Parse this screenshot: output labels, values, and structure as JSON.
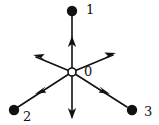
{
  "figure": {
    "colors": {
      "stroke": "#111111",
      "dot_fill": "#111111",
      "origin_fill": "#ffffff",
      "background": "#ffffff"
    },
    "geometry": {
      "origin": {
        "x": 72,
        "y": 72,
        "radius": 4
      },
      "dot_radius": 5,
      "stroke_width": 1.6
    }
  },
  "labels": {
    "origin": "0",
    "node_1": "1",
    "node_2": "2",
    "node_3": "3"
  },
  "nodes": [
    {
      "id": "origin",
      "label": "0",
      "x": 72,
      "y": 72,
      "style": "open-circle"
    },
    {
      "id": "node-1",
      "label": "1",
      "x": 72,
      "y": 11,
      "style": "filled-dot"
    },
    {
      "id": "node-2",
      "label": "2",
      "x": 14,
      "y": 110,
      "style": "filled-dot"
    },
    {
      "id": "node-3",
      "label": "3",
      "x": 132,
      "y": 110,
      "style": "filled-dot"
    }
  ],
  "rays": [
    {
      "id": "ray-up",
      "from": [
        72,
        72
      ],
      "to": [
        72,
        13
      ],
      "arrow_at": [
        72,
        42
      ],
      "arrow_dir": "up",
      "terminates_at_dot": true
    },
    {
      "id": "ray-down-left",
      "from": [
        72,
        72
      ],
      "to": [
        18,
        108
      ],
      "arrow_at": [
        43,
        89
      ],
      "arrow_dir": "down-left",
      "terminates_at_dot": true
    },
    {
      "id": "ray-down-right",
      "from": [
        72,
        72
      ],
      "to": [
        127,
        108
      ],
      "arrow_at": [
        102,
        89
      ],
      "arrow_dir": "down-right",
      "terminates_at_dot": true
    },
    {
      "id": "ray-up-left",
      "from": [
        72,
        72
      ],
      "to": [
        35,
        56
      ],
      "arrow_at": [
        35,
        56
      ],
      "arrow_dir": "up-left",
      "terminates_at_dot": false
    },
    {
      "id": "ray-up-right",
      "from": [
        72,
        72
      ],
      "to": [
        114,
        54
      ],
      "arrow_at": [
        114,
        54
      ],
      "arrow_dir": "up-right",
      "terminates_at_dot": false
    },
    {
      "id": "ray-down",
      "from": [
        72,
        72
      ],
      "to": [
        72,
        118
      ],
      "arrow_at": [
        72,
        118
      ],
      "arrow_dir": "down",
      "terminates_at_dot": false
    }
  ]
}
